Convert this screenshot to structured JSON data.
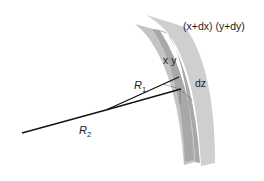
{
  "diagram": {
    "labels": {
      "outer_coords": "(x+dx) (y+dy)",
      "inner_coords": "x y",
      "thickness": "dz",
      "r1_base": "R",
      "r1_sub": "1",
      "r2_base": "R",
      "r2_sub": "2"
    },
    "colors": {
      "sheet_back": "#c9c9c9",
      "sheet_front": "#bdbdbd",
      "overlap": "#a3a3a3",
      "line": "#111111",
      "dotted": "#555555"
    }
  }
}
